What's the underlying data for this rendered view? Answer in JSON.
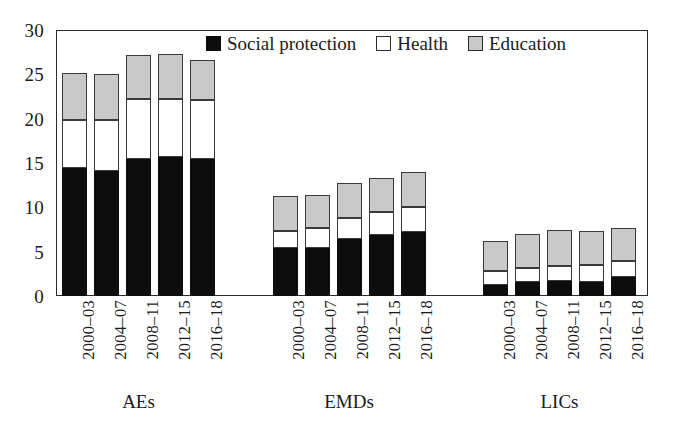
{
  "chart_data": {
    "type": "bar",
    "subtype": "stacked-bar-grouped",
    "title": "",
    "xlabel": "",
    "ylabel": "",
    "ylim": [
      0,
      30
    ],
    "yticks": [
      0,
      5,
      10,
      15,
      20,
      25,
      30
    ],
    "ytick_labels": [
      "0",
      "5",
      "10",
      "15",
      "20",
      "25",
      "30"
    ],
    "grid": false,
    "legend_position": "top-center",
    "categories": [
      "2000–03",
      "2004–07",
      "2008–11",
      "2012–15",
      "2016–18"
    ],
    "groups": [
      {
        "name": "AEs",
        "categories": [
          "2000–03",
          "2004–07",
          "2008–11",
          "2012–15",
          "2016–18"
        ],
        "series": [
          {
            "name": "Social protection",
            "values": [
              14.4,
              14.1,
              15.5,
              15.7,
              15.4
            ]
          },
          {
            "name": "Health",
            "values": [
              5.4,
              5.7,
              6.7,
              6.5,
              6.7
            ]
          },
          {
            "name": "Education",
            "values": [
              5.3,
              5.2,
              5.0,
              5.1,
              4.5
            ]
          }
        ],
        "totals": [
          25.1,
          25.0,
          27.2,
          27.3,
          26.6
        ]
      },
      {
        "name": "EMDs",
        "categories": [
          "2000–03",
          "2004–07",
          "2008–11",
          "2012–15",
          "2016–18"
        ],
        "series": [
          {
            "name": "Social protection",
            "values": [
              5.4,
              5.4,
              6.4,
              6.9,
              7.2
            ]
          },
          {
            "name": "Health",
            "values": [
              1.9,
              2.3,
              2.4,
              2.6,
              2.8
            ]
          },
          {
            "name": "Education",
            "values": [
              4.0,
              3.7,
              3.9,
              3.8,
              4.0
            ]
          }
        ],
        "totals": [
          11.3,
          11.4,
          12.7,
          13.3,
          14.0
        ]
      },
      {
        "name": "LICs",
        "categories": [
          "2000–03",
          "2004–07",
          "2008–11",
          "2012–15",
          "2016–18"
        ],
        "series": [
          {
            "name": "Social protection",
            "values": [
              1.2,
              1.6,
              1.7,
              1.6,
              2.2
            ]
          },
          {
            "name": "Health",
            "values": [
              1.6,
              1.6,
              1.7,
              1.9,
              1.8
            ]
          },
          {
            "name": "Education",
            "values": [
              3.4,
              3.8,
              4.0,
              3.8,
              3.7
            ]
          }
        ],
        "totals": [
          6.2,
          7.0,
          7.4,
          7.3,
          7.7
        ]
      }
    ],
    "series_order": [
      "Social protection",
      "Health",
      "Education"
    ],
    "colors": {
      "Social protection": "#0d0d0d",
      "Health": "#ffffff",
      "Education": "#c9c9c9",
      "axis": "#2b2b2b",
      "background": "#ffffff"
    }
  },
  "legend": {
    "entries": [
      {
        "label": "Social protection",
        "swatch": "social"
      },
      {
        "label": "Health",
        "swatch": "health"
      },
      {
        "label": "Education",
        "swatch": "educ"
      }
    ]
  }
}
